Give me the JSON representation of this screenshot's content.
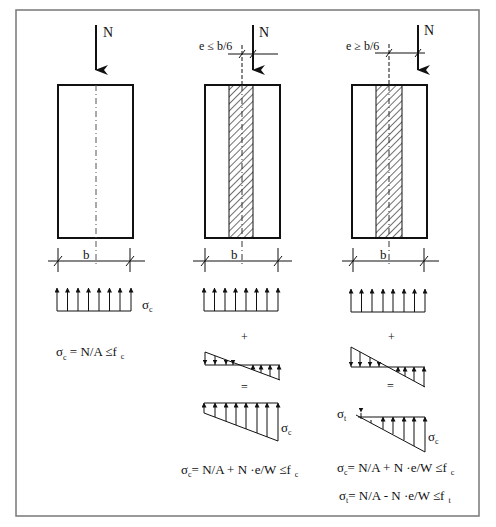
{
  "diagram": {
    "frame": {
      "stroke": "#777777"
    },
    "colors": {
      "line": "#111111",
      "hatch": "#222222",
      "axis": "#555555"
    },
    "columns": [
      {
        "id": "centric",
        "load_label": "N",
        "eccentricity_label": "",
        "width_label": "b",
        "stress_uniform_label": "σ",
        "stress_uniform_sub": "c",
        "formula_1": {
          "sigma": "σ",
          "sub": "c",
          "text": " = N/A  ≤f",
          "limit_sub": "c"
        }
      },
      {
        "id": "small-eccentricity",
        "load_label": "N",
        "eccentricity_label": "e ≤ b/6",
        "width_label": "b",
        "plus": "+",
        "equals": "=",
        "result_label_sigma": "σ",
        "result_label_sub": "c",
        "formula_1": {
          "sigma": "σ",
          "sub": "c",
          "text": "= N/A + N ·e/W  ≤f",
          "limit_sub": "c"
        }
      },
      {
        "id": "large-eccentricity",
        "load_label": "N",
        "eccentricity_label": "e ≥ b/6",
        "width_label": "b",
        "plus": "+",
        "equals": "=",
        "tension_label_sigma": "σ",
        "tension_label_sub": "t",
        "result_label_sigma": "σ",
        "result_label_sub": "c",
        "formula_1": {
          "sigma": "σ",
          "sub": "c",
          "text": "= N/A + N ·e/W  ≤f",
          "limit_sub": "c"
        },
        "formula_2": {
          "sigma": "σ",
          "sub": "t",
          "text": "= N/A -  N ·e/W  ≤f",
          "limit_sub": "t"
        }
      }
    ]
  }
}
